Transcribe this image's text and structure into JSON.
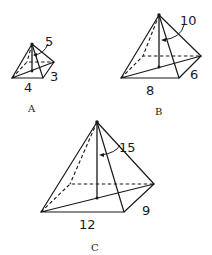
{
  "diagram": {
    "type": "pyramid-comparison",
    "pyramids": [
      {
        "label": "A",
        "slant_height": "5",
        "base_width": "4",
        "base_depth": "3"
      },
      {
        "label": "B",
        "slant_height": "10",
        "base_width": "8",
        "base_depth": "6"
      },
      {
        "label": "C",
        "slant_height": "15",
        "base_width": "12",
        "base_depth": "9"
      }
    ],
    "colors": {
      "line": "#1a1a1a",
      "background": "#ffffff"
    }
  }
}
